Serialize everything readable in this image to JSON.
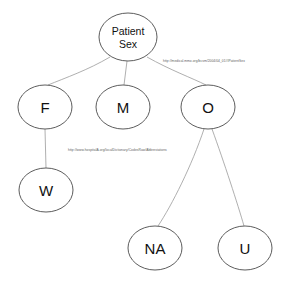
{
  "diagram": {
    "type": "node-link-tree",
    "background_color": "#ffffff",
    "node_fill": "#ffffff",
    "node_stroke": "#4a4a4a",
    "edge_stroke": "#9a9a9a",
    "label_color": "#111111",
    "edge_label_color": "#5d5d5d",
    "nodes": [
      {
        "id": "patient-sex",
        "label_line1": "Patient",
        "label_line2": "Sex",
        "cx": 128,
        "cy": 37,
        "rx": 29,
        "ry": 24
      },
      {
        "id": "f",
        "label_line1": "F",
        "label_line2": "",
        "cx": 45,
        "cy": 107,
        "rx": 27,
        "ry": 22
      },
      {
        "id": "m",
        "label_line1": "M",
        "label_line2": "",
        "cx": 123,
        "cy": 107,
        "rx": 27,
        "ry": 22
      },
      {
        "id": "o",
        "label_line1": "O",
        "label_line2": "",
        "cx": 208,
        "cy": 107,
        "rx": 27,
        "ry": 22
      },
      {
        "id": "w",
        "label_line1": "W",
        "label_line2": "",
        "cx": 46,
        "cy": 190,
        "rx": 27,
        "ry": 22
      },
      {
        "id": "na",
        "label_line1": "NA",
        "label_line2": "",
        "cx": 155,
        "cy": 248,
        "rx": 27,
        "ry": 22
      },
      {
        "id": "u",
        "label_line1": "U",
        "label_line2": "",
        "cx": 245,
        "cy": 248,
        "rx": 27,
        "ry": 22
      }
    ],
    "edges": [
      {
        "id": "patient-sex-to-f",
        "from": "patient-sex",
        "to": "f",
        "path": "M 110 57 C 88 70 65 78 48 85"
      },
      {
        "id": "patient-sex-to-m",
        "from": "patient-sex",
        "to": "m",
        "path": "M 127 61 L 124 85"
      },
      {
        "id": "patient-sex-to-o",
        "from": "patient-sex",
        "to": "o",
        "path": "M 147 57 C 170 70 192 78 206 85"
      },
      {
        "id": "f-to-w",
        "from": "f",
        "to": "w",
        "path": "M 45 129 L 46 168"
      },
      {
        "id": "o-to-na",
        "from": "o",
        "to": "na",
        "path": "M 204 129 C 192 165 172 205 158 226"
      },
      {
        "id": "o-to-u",
        "from": "o",
        "to": "u",
        "path": "M 212 129 C 224 162 238 205 244 226"
      }
    ],
    "edge_labels": [
      {
        "id": "patient-sex-uri",
        "text": "http://medical.mmo.org/bcsm/2004/04_01#IPatientSex",
        "x": 163,
        "y": 61
      },
      {
        "id": "other-sex-uri",
        "text": "http://www.hospitalA.org/localDictionary/CodesRaw/Abbreviations",
        "x": 68,
        "y": 150
      }
    ]
  }
}
